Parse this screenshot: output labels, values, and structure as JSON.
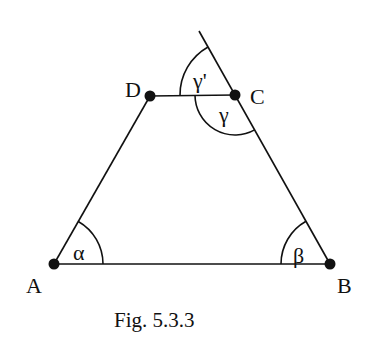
{
  "figure": {
    "caption": "Fig. 5.3.3",
    "shape": "trapezoid",
    "colors": {
      "stroke": "#111111",
      "background": "#ffffff"
    }
  },
  "points": {
    "A": {
      "label": "A",
      "x": 54,
      "y": 264
    },
    "B": {
      "label": "B",
      "x": 330,
      "y": 264
    },
    "C": {
      "label": "C",
      "x": 235,
      "y": 95
    },
    "D": {
      "label": "D",
      "x": 150,
      "y": 96
    }
  },
  "segments": [
    "AB",
    "BC",
    "CD",
    "DA"
  ],
  "extension": {
    "from": "B",
    "through": "C",
    "label": "extension of BC beyond C"
  },
  "angles": {
    "alpha": {
      "label": "α",
      "vertex": "A"
    },
    "beta": {
      "label": "β",
      "vertex": "B"
    },
    "gamma": {
      "label": "γ",
      "vertex": "C",
      "between": "CD and CB"
    },
    "gamma_prime": {
      "label": "γ'",
      "vertex": "C",
      "between": "CD and extension of BC"
    }
  }
}
